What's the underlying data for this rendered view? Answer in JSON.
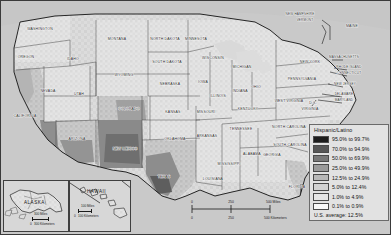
{
  "map": {
    "title": "",
    "type": "choropleth-thematic-map",
    "subject": "Hispanic/Latino population percentage by county, United States"
  },
  "legend": {
    "title": "Hispanic/Latino",
    "classes": [
      {
        "label": "95.0% to 99.7%",
        "color": "#1c1c1c"
      },
      {
        "label": "70.0% to 94.9%",
        "color": "#565656"
      },
      {
        "label": "50.0% to 69.9%",
        "color": "#787878"
      },
      {
        "label": "25.0% to 49.9%",
        "color": "#9a9a9a"
      },
      {
        "label": "12.5% to 24.9%",
        "color": "#b8b8b8"
      },
      {
        "label": "5.0% to 12.4%",
        "color": "#d2d2d2"
      },
      {
        "label": "1.0% to 4.9%",
        "color": "#e6e6e6"
      },
      {
        "label": "0.1% to 0.9%",
        "color": "#f8f8f8"
      }
    ],
    "average_note": "U.S. average: 12.5%"
  },
  "scalebars": {
    "main": {
      "miles_ticks": [
        "0",
        "250",
        "500 Miles"
      ],
      "km_ticks": [
        "0",
        "250",
        "500 Kilometers"
      ]
    },
    "alaska": {
      "miles": "300 Miles",
      "km_zero": "0",
      "km": "300 Kilometers"
    },
    "hawaii": {
      "miles": "100 Miles",
      "km_zero": "0",
      "km": "100 Kilometers"
    }
  },
  "insets": [
    {
      "name": "ALASKA"
    },
    {
      "name": "HAWAII"
    }
  ],
  "state_labels": [
    {
      "name": "WASHINGTON",
      "x": 40,
      "y": 30
    },
    {
      "name": "OREGON",
      "x": 26,
      "y": 58
    },
    {
      "name": "IDAHO",
      "x": 73,
      "y": 60
    },
    {
      "name": "MONTANA",
      "x": 117,
      "y": 40
    },
    {
      "name": "WYOMING",
      "x": 124,
      "y": 76
    },
    {
      "name": "NORTH DAKOTA",
      "x": 165,
      "y": 40
    },
    {
      "name": "SOUTH DAKOTA",
      "x": 167,
      "y": 63
    },
    {
      "name": "NEBRASKA",
      "x": 170,
      "y": 85
    },
    {
      "name": "MINNESOTA",
      "x": 196,
      "y": 40
    },
    {
      "name": "WISCONSIN",
      "x": 213,
      "y": 59
    },
    {
      "name": "MICHIGAN",
      "x": 242,
      "y": 68
    },
    {
      "name": "IOWA",
      "x": 203,
      "y": 83
    },
    {
      "name": "ILLINOIS",
      "x": 218,
      "y": 97
    },
    {
      "name": "INDIANA",
      "x": 240,
      "y": 92
    },
    {
      "name": "OHIO",
      "x": 256,
      "y": 88
    },
    {
      "name": "NEVADA",
      "x": 48,
      "y": 92
    },
    {
      "name": "UTAH",
      "x": 79,
      "y": 95
    },
    {
      "name": "CALIFORNIA",
      "x": 25,
      "y": 117
    },
    {
      "name": "COLORADO",
      "x": 129,
      "y": 110
    },
    {
      "name": "KANSAS",
      "x": 173,
      "y": 113
    },
    {
      "name": "MISSOURI",
      "x": 206,
      "y": 113
    },
    {
      "name": "KENTUCKY",
      "x": 248,
      "y": 110
    },
    {
      "name": "ARIZONA",
      "x": 77,
      "y": 140
    },
    {
      "name": "NEW MEXICO",
      "x": 125,
      "y": 150
    },
    {
      "name": "OKLAHOMA",
      "x": 175,
      "y": 140
    },
    {
      "name": "ARKANSAS",
      "x": 207,
      "y": 137
    },
    {
      "name": "TENNESSEE",
      "x": 241,
      "y": 130
    },
    {
      "name": "TEXAS",
      "x": 164,
      "y": 178
    },
    {
      "name": "LOUISIANA",
      "x": 213,
      "y": 180
    },
    {
      "name": "MISSISSIPPI",
      "x": 229,
      "y": 165
    },
    {
      "name": "ALABAMA",
      "x": 252,
      "y": 155
    },
    {
      "name": "GEORGIA",
      "x": 272,
      "y": 156
    },
    {
      "name": "FLORIDA",
      "x": 297,
      "y": 188
    },
    {
      "name": "NORTH CAROLINA",
      "x": 289,
      "y": 128
    },
    {
      "name": "SOUTH CAROLINA",
      "x": 290,
      "y": 146
    },
    {
      "name": "VIRGINIA",
      "x": 310,
      "y": 110
    },
    {
      "name": "WEST VIRGINIA",
      "x": 289,
      "y": 102
    },
    {
      "name": "PENNSYLVANIA",
      "x": 302,
      "y": 80
    },
    {
      "name": "NEW YORK",
      "x": 310,
      "y": 63
    },
    {
      "name": "MAINE",
      "x": 352,
      "y": 27
    },
    {
      "name": "D.C.",
      "x": 313,
      "y": 104
    }
  ],
  "leader_labels": [
    {
      "name": "NEW HAMPSHIRE",
      "x": 300,
      "y": 15
    },
    {
      "name": "VERMONT",
      "x": 305,
      "y": 21
    },
    {
      "name": "MASSACHUSETTS",
      "x": 344,
      "y": 58
    },
    {
      "name": "RHODE ISLAND",
      "x": 349,
      "y": 68
    },
    {
      "name": "CONNECTICUT",
      "x": 349,
      "y": 74
    },
    {
      "name": "NEW JERSEY",
      "x": 345,
      "y": 85
    },
    {
      "name": "DELAWARE",
      "x": 344,
      "y": 95
    },
    {
      "name": "MARYLAND",
      "x": 344,
      "y": 101
    }
  ]
}
